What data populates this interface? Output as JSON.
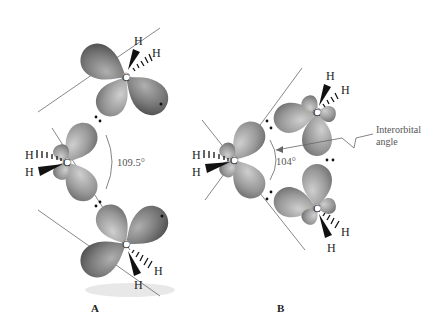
{
  "figure": {
    "panels": [
      {
        "label": "A",
        "angle_label": "109.5°"
      },
      {
        "label": "B",
        "angle_label": "104°"
      }
    ],
    "annotation": {
      "line1": "Interorbital",
      "line2": "angle"
    },
    "atoms": {
      "carbon": "C",
      "hydrogen": "H"
    },
    "colors": {
      "lobe_dark": "#7a7a7a",
      "lobe_light": "#a8a8a8",
      "axis": "#555555",
      "wedge": "#111111"
    }
  }
}
